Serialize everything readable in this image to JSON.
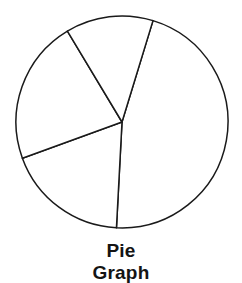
{
  "caption": {
    "line1": "Pie",
    "line2": "Graph"
  },
  "colors": {
    "background": "#ffffff",
    "stroke": "#1a1a1a",
    "slice_fill": "#ffffff",
    "caption_text": "#141414"
  },
  "chart_data": {
    "type": "pie",
    "title": "Pie Graph",
    "xlabel": "",
    "ylabel": "",
    "grid": false,
    "legend": "none",
    "labels": [
      "Slice 1",
      "Slice 2",
      "Slice 3",
      "Slice 4"
    ],
    "values": [
      166,
      67,
      79,
      48
    ],
    "unit": "degrees",
    "percentages": [
      46.1,
      18.6,
      21.9,
      13.3
    ],
    "start_angle_deg": 17,
    "direction": "clockwise",
    "boundary_angles_deg": [
      17,
      183,
      250,
      329
    ],
    "center": {
      "x": 122,
      "y": 122
    },
    "radius": 106,
    "filled": false,
    "annotations": []
  }
}
